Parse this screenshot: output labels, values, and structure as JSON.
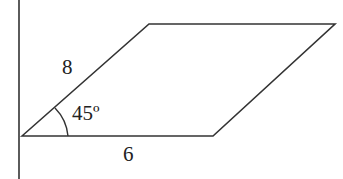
{
  "diagram": {
    "shape": "parallelogram",
    "labels": {
      "side_left": "8",
      "side_bottom": "6",
      "angle": "45º"
    },
    "colors": {
      "stroke": "#333333",
      "text": "#222222",
      "background": "#ffffff"
    }
  }
}
